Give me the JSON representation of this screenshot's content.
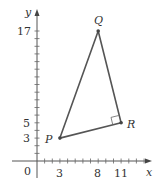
{
  "diagram": {
    "type": "coordinate-plane-triangle",
    "axes": {
      "x_label": "x",
      "y_label": "y",
      "origin_label": "0",
      "x_tick_labels": [
        "3",
        "8",
        "11"
      ],
      "y_tick_labels": [
        "3",
        "5",
        "17"
      ]
    },
    "points": [
      {
        "name": "P",
        "x": 3,
        "y": 3
      },
      {
        "name": "Q",
        "x": 8,
        "y": 17
      },
      {
        "name": "R",
        "x": 11,
        "y": 5
      }
    ],
    "right_angle_at": "R",
    "colors": {
      "triangle": "#555555",
      "axes": "#555555",
      "text": "#333333"
    }
  }
}
